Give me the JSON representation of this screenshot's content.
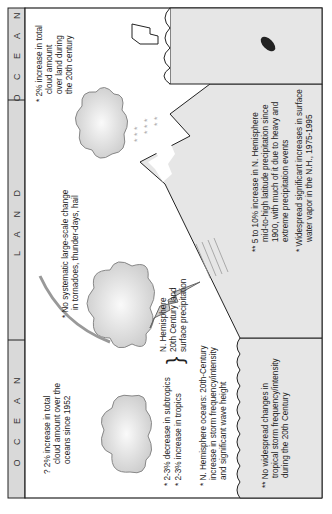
{
  "header": {
    "sections": [
      {
        "label": "O C E A N"
      },
      {
        "label": "L A N D"
      },
      {
        "label": "O C E A N"
      }
    ]
  },
  "annotations": {
    "ocean_left_cloud": [
      "? 2% increase in total",
      "cloud amount over the",
      "oceans since 1952"
    ],
    "subtropics_tropics": [
      "* 2-3% decrease in subtropics",
      "* 2-3% increase in tropics"
    ],
    "nh_land_precip": [
      "N. Hemisphere",
      "20th Century land",
      "surface precipitation"
    ],
    "nh_oceans_storm": [
      "* N. Hemisphere oceans: 20th-Century",
      "increase in storm frequency/intensity",
      "and significant wave height"
    ],
    "tropical_storm": [
      "** No widespread changes in",
      "tropical storm frequency/intensity",
      "during the 20th Century"
    ],
    "tornadoes": [
      "* No systematic large-scale change",
      "in tornadoes, thunder-days, hail"
    ],
    "land_cloud": [
      "* 2% increase in total",
      "cloud amount",
      "over land during",
      "the 20th century"
    ],
    "nh_mid_high": [
      "** 5 to 10% increase in N. Hemisphere",
      "mid-to-high latitude precipitation since",
      "1900, with much of it due to heavy and",
      "extreme precipitation events"
    ],
    "water_vapor": [
      "* Widespread significant increases in surface",
      "water vapor in the N.H., 1975-1995"
    ]
  },
  "colors": {
    "header_fill": "#d9d9d9",
    "panel_fill": "#e6e6e6",
    "cloud_fill": "#d4d4d4",
    "frame": "#222222"
  }
}
